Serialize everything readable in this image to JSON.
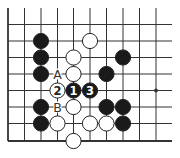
{
  "diagram": {
    "type": "go-board-fragment",
    "grid": {
      "columns_x": [
        8,
        24.5,
        41,
        57.5,
        73.5,
        90,
        106.5,
        123,
        139.5,
        156
      ],
      "rows_y": [
        24.5,
        41,
        57.5,
        74,
        90.5,
        107,
        123.5,
        141
      ],
      "left_edge": true,
      "bottom_edge": true,
      "line_top_y": 8,
      "line_right_x": 172,
      "line_color": "#333333",
      "star_points": [
        {
          "col": 9,
          "row": 4
        }
      ]
    },
    "stones": [
      {
        "color": "black",
        "col": 2,
        "row": 1
      },
      {
        "color": "black",
        "col": 2,
        "row": 2
      },
      {
        "color": "black",
        "col": 2,
        "row": 3
      },
      {
        "color": "black",
        "col": 2,
        "row": 5
      },
      {
        "color": "black",
        "col": 2,
        "row": 6
      },
      {
        "color": "white",
        "col": 5,
        "row": 1
      },
      {
        "color": "white",
        "col": 4,
        "row": 2
      },
      {
        "color": "white",
        "col": 4,
        "row": 3
      },
      {
        "color": "black",
        "col": 7,
        "row": 2
      },
      {
        "color": "black",
        "col": 6,
        "row": 3
      },
      {
        "color": "white",
        "col": 3,
        "row": 4,
        "label": "2"
      },
      {
        "color": "black",
        "col": 4,
        "row": 4,
        "label": "1"
      },
      {
        "color": "black",
        "col": 5,
        "row": 4,
        "label": "3"
      },
      {
        "color": "white",
        "col": 4,
        "row": 5
      },
      {
        "color": "black",
        "col": 6,
        "row": 5
      },
      {
        "color": "black",
        "col": 7,
        "row": 5
      },
      {
        "color": "white",
        "col": 3,
        "row": 6
      },
      {
        "color": "white",
        "col": 5,
        "row": 6
      },
      {
        "color": "white",
        "col": 6,
        "row": 6
      },
      {
        "color": "black",
        "col": 7,
        "row": 6
      },
      {
        "color": "white",
        "col": 4,
        "row": 7
      }
    ],
    "markers": [
      {
        "text": "A",
        "col": 3,
        "row": 3
      },
      {
        "text": "B",
        "col": 3,
        "row": 5
      }
    ],
    "colors": {
      "black_stone": "#1a1a1a",
      "white_stone": "#ffffff",
      "stone_outline": "#222222",
      "background": "#ffffff"
    }
  }
}
